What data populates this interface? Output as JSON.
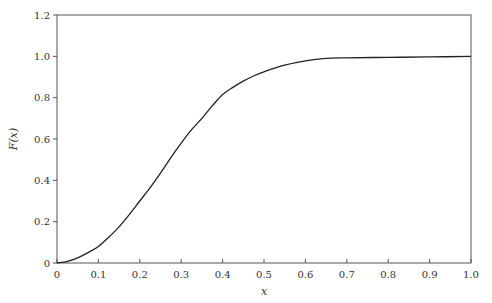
{
  "chart_data": {
    "type": "line",
    "title": "",
    "xlabel": "x",
    "ylabel": "F(x)",
    "xlim": [
      0,
      1.0
    ],
    "ylim": [
      0,
      1.2
    ],
    "grid": false,
    "legend": null,
    "x_ticks": [
      "0",
      "0.1",
      "0.2",
      "0.3",
      "0.4",
      "0.5",
      "0.6",
      "0.7",
      "0.8",
      "0.9",
      "1.0"
    ],
    "y_ticks": [
      "0",
      "0.2",
      "0.4",
      "0.6",
      "0.8",
      "1.0",
      "1.2"
    ],
    "series": [
      {
        "name": "F(x)",
        "color": "#222222",
        "x": [
          0,
          0.025,
          0.05,
          0.075,
          0.1,
          0.125,
          0.15,
          0.175,
          0.2,
          0.225,
          0.25,
          0.275,
          0.3,
          0.325,
          0.35,
          0.375,
          0.4,
          0.425,
          0.45,
          0.475,
          0.5,
          0.55,
          0.6,
          0.65,
          0.7,
          0.8,
          0.9,
          1.0
        ],
        "y": [
          0,
          0.008,
          0.025,
          0.05,
          0.08,
          0.125,
          0.175,
          0.235,
          0.3,
          0.365,
          0.435,
          0.51,
          0.58,
          0.645,
          0.7,
          0.76,
          0.815,
          0.85,
          0.88,
          0.905,
          0.925,
          0.957,
          0.978,
          0.99,
          0.993,
          0.995,
          0.997,
          1.0
        ]
      }
    ]
  }
}
